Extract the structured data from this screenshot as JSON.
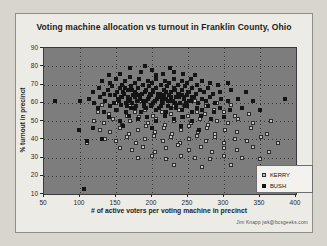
{
  "title": "Voting machine allocation vs turnout in Franklin County, Ohio",
  "credit": "Jim Knapp   jwk@bcsgeeks.com",
  "colors": {
    "page_background": "#d8d5cf",
    "panel_background": "#edebe6",
    "plot_background": "#7d7d7d",
    "kerry_marker_fill": "#c7c5c0",
    "kerry_marker_border": "#2d2d2d",
    "bush_marker": "#141414"
  },
  "chart_data": {
    "type": "scatter",
    "title": "Voting machine allocation vs turnout in Franklin County, Ohio",
    "xlabel": "# of active voters per voting machine in precinct",
    "ylabel": "% turnout in precinct",
    "xlim": [
      50,
      400
    ],
    "ylim": [
      10,
      90
    ],
    "xticks": [
      50,
      100,
      150,
      200,
      250,
      300,
      350,
      400
    ],
    "yticks": [
      10,
      20,
      30,
      40,
      50,
      60,
      70,
      80,
      90
    ],
    "grid": true,
    "legend_position": "inside-bottom-right",
    "series": [
      {
        "name": "KERRY",
        "marker": "open-square",
        "points": [
          [
            130,
            59
          ],
          [
            150,
            60
          ],
          [
            170,
            58
          ],
          [
            185,
            61
          ],
          [
            200,
            59
          ],
          [
            215,
            60
          ],
          [
            230,
            58
          ],
          [
            245,
            59
          ],
          [
            260,
            61
          ],
          [
            275,
            58
          ],
          [
            290,
            60
          ],
          [
            310,
            59
          ],
          [
            125,
            55
          ],
          [
            140,
            54
          ],
          [
            152,
            56
          ],
          [
            165,
            53
          ],
          [
            177,
            55
          ],
          [
            190,
            56
          ],
          [
            202,
            53
          ],
          [
            214,
            55
          ],
          [
            226,
            54
          ],
          [
            238,
            56
          ],
          [
            250,
            53
          ],
          [
            262,
            55
          ],
          [
            274,
            54
          ],
          [
            286,
            56
          ],
          [
            300,
            55
          ],
          [
            315,
            53
          ],
          [
            335,
            54
          ],
          [
            120,
            50
          ],
          [
            133,
            49
          ],
          [
            146,
            51
          ],
          [
            158,
            48
          ],
          [
            170,
            50
          ],
          [
            182,
            52
          ],
          [
            194,
            49
          ],
          [
            206,
            51
          ],
          [
            218,
            48
          ],
          [
            230,
            50
          ],
          [
            242,
            52
          ],
          [
            254,
            49
          ],
          [
            266,
            51
          ],
          [
            278,
            48
          ],
          [
            290,
            50
          ],
          [
            305,
            49
          ],
          [
            320,
            51
          ],
          [
            340,
            49
          ],
          [
            365,
            50
          ],
          [
            128,
            45
          ],
          [
            142,
            44
          ],
          [
            155,
            46
          ],
          [
            168,
            43
          ],
          [
            180,
            45
          ],
          [
            192,
            47
          ],
          [
            204,
            44
          ],
          [
            216,
            46
          ],
          [
            228,
            43
          ],
          [
            240,
            45
          ],
          [
            252,
            47
          ],
          [
            264,
            44
          ],
          [
            276,
            46
          ],
          [
            288,
            43
          ],
          [
            302,
            45
          ],
          [
            318,
            44
          ],
          [
            338,
            46
          ],
          [
            360,
            43
          ],
          [
            135,
            40
          ],
          [
            150,
            39
          ],
          [
            165,
            41
          ],
          [
            178,
            38
          ],
          [
            190,
            40
          ],
          [
            203,
            42
          ],
          [
            215,
            39
          ],
          [
            227,
            41
          ],
          [
            239,
            38
          ],
          [
            251,
            40
          ],
          [
            263,
            42
          ],
          [
            275,
            39
          ],
          [
            287,
            41
          ],
          [
            300,
            38
          ],
          [
            315,
            40
          ],
          [
            332,
            39
          ],
          [
            352,
            41
          ],
          [
            375,
            38
          ],
          [
            110,
            38
          ],
          [
            155,
            35
          ],
          [
            172,
            34
          ],
          [
            188,
            36
          ],
          [
            204,
            33
          ],
          [
            220,
            35
          ],
          [
            236,
            37
          ],
          [
            252,
            34
          ],
          [
            268,
            36
          ],
          [
            284,
            33
          ],
          [
            300,
            35
          ],
          [
            318,
            34
          ],
          [
            340,
            36
          ],
          [
            362,
            33
          ],
          [
            180,
            30
          ],
          [
            200,
            31
          ],
          [
            220,
            29
          ],
          [
            240,
            31
          ],
          [
            260,
            30
          ],
          [
            280,
            29
          ],
          [
            300,
            31
          ],
          [
            325,
            30
          ],
          [
            350,
            29
          ],
          [
            230,
            26
          ],
          [
            270,
            25
          ],
          [
            310,
            26
          ]
        ]
      },
      {
        "name": "BUSH",
        "marker": "filled-square",
        "points": [
          [
            170,
            79
          ],
          [
            190,
            80
          ],
          [
            185,
            77
          ],
          [
            200,
            78
          ],
          [
            215,
            76
          ],
          [
            225,
            79
          ],
          [
            230,
            77
          ],
          [
            155,
            76
          ],
          [
            243,
            76
          ],
          [
            140,
            75
          ],
          [
            260,
            75
          ],
          [
            205,
            75
          ],
          [
            130,
            72
          ],
          [
            142,
            71
          ],
          [
            150,
            73
          ],
          [
            158,
            70
          ],
          [
            163,
            72
          ],
          [
            170,
            74
          ],
          [
            176,
            71
          ],
          [
            182,
            73
          ],
          [
            188,
            70
          ],
          [
            194,
            72
          ],
          [
            200,
            71
          ],
          [
            206,
            73
          ],
          [
            212,
            70
          ],
          [
            218,
            72
          ],
          [
            224,
            71
          ],
          [
            230,
            73
          ],
          [
            236,
            70
          ],
          [
            242,
            72
          ],
          [
            248,
            71
          ],
          [
            254,
            73
          ],
          [
            262,
            70
          ],
          [
            270,
            72
          ],
          [
            280,
            71
          ],
          [
            292,
            70
          ],
          [
            305,
            71
          ],
          [
            118,
            66
          ],
          [
            126,
            68
          ],
          [
            133,
            65
          ],
          [
            139,
            67
          ],
          [
            145,
            69
          ],
          [
            151,
            66
          ],
          [
            156,
            68
          ],
          [
            161,
            65
          ],
          [
            166,
            67
          ],
          [
            171,
            69
          ],
          [
            176,
            66
          ],
          [
            181,
            68
          ],
          [
            186,
            65
          ],
          [
            191,
            67
          ],
          [
            196,
            69
          ],
          [
            201,
            66
          ],
          [
            206,
            68
          ],
          [
            211,
            65
          ],
          [
            216,
            67
          ],
          [
            221,
            69
          ],
          [
            226,
            66
          ],
          [
            231,
            68
          ],
          [
            236,
            65
          ],
          [
            241,
            67
          ],
          [
            246,
            69
          ],
          [
            251,
            66
          ],
          [
            256,
            68
          ],
          [
            261,
            65
          ],
          [
            266,
            67
          ],
          [
            272,
            66
          ],
          [
            278,
            68
          ],
          [
            285,
            65
          ],
          [
            295,
            66
          ],
          [
            310,
            67
          ],
          [
            330,
            66
          ],
          [
            112,
            62
          ],
          [
            120,
            60
          ],
          [
            128,
            63
          ],
          [
            135,
            61
          ],
          [
            141,
            64
          ],
          [
            147,
            60
          ],
          [
            153,
            62
          ],
          [
            159,
            63
          ],
          [
            164,
            60
          ],
          [
            169,
            62
          ],
          [
            174,
            64
          ],
          [
            179,
            61
          ],
          [
            184,
            63
          ],
          [
            189,
            60
          ],
          [
            194,
            62
          ],
          [
            199,
            64
          ],
          [
            204,
            61
          ],
          [
            209,
            63
          ],
          [
            214,
            60
          ],
          [
            219,
            62
          ],
          [
            224,
            64
          ],
          [
            229,
            61
          ],
          [
            234,
            63
          ],
          [
            239,
            60
          ],
          [
            244,
            62
          ],
          [
            249,
            64
          ],
          [
            254,
            61
          ],
          [
            259,
            63
          ],
          [
            264,
            60
          ],
          [
            269,
            62
          ],
          [
            275,
            61
          ],
          [
            281,
            63
          ],
          [
            288,
            60
          ],
          [
            296,
            62
          ],
          [
            306,
            61
          ],
          [
            320,
            62
          ],
          [
            340,
            61
          ],
          [
            65,
            61
          ],
          [
            100,
            61
          ],
          [
            385,
            62
          ],
          [
            148,
            64
          ],
          [
            154,
            61
          ],
          [
            160,
            66
          ],
          [
            166,
            63
          ],
          [
            172,
            60
          ],
          [
            178,
            65
          ],
          [
            184,
            62
          ],
          [
            190,
            66
          ],
          [
            196,
            63
          ],
          [
            202,
            60
          ],
          [
            208,
            65
          ],
          [
            214,
            62
          ],
          [
            220,
            66
          ],
          [
            226,
            63
          ],
          [
            232,
            60
          ],
          [
            238,
            65
          ],
          [
            244,
            63
          ],
          [
            250,
            66
          ],
          [
            256,
            63
          ],
          [
            157,
            63
          ],
          [
            167,
            61
          ],
          [
            177,
            63
          ],
          [
            187,
            61
          ],
          [
            197,
            65
          ],
          [
            207,
            62
          ],
          [
            217,
            64
          ],
          [
            227,
            61
          ],
          [
            237,
            63
          ],
          [
            247,
            60
          ],
          [
            172,
            67
          ],
          [
            182,
            64
          ],
          [
            192,
            61
          ],
          [
            202,
            67
          ],
          [
            212,
            64
          ],
          [
            222,
            61
          ],
          [
            232,
            67
          ],
          [
            242,
            64
          ],
          [
            252,
            61
          ],
          [
            162,
            68
          ],
          [
            198,
            58
          ],
          [
            210,
            57
          ],
          [
            222,
            58
          ],
          [
            234,
            57
          ],
          [
            246,
            58
          ],
          [
            165,
            58
          ],
          [
            177,
            57
          ],
          [
            189,
            58
          ],
          [
            125,
            57
          ],
          [
            134,
            55
          ],
          [
            142,
            58
          ],
          [
            150,
            56
          ],
          [
            157,
            59
          ],
          [
            164,
            55
          ],
          [
            171,
            57
          ],
          [
            178,
            58
          ],
          [
            185,
            55
          ],
          [
            192,
            57
          ],
          [
            199,
            59
          ],
          [
            206,
            56
          ],
          [
            213,
            58
          ],
          [
            220,
            55
          ],
          [
            227,
            57
          ],
          [
            234,
            59
          ],
          [
            241,
            56
          ],
          [
            248,
            58
          ],
          [
            255,
            55
          ],
          [
            262,
            57
          ],
          [
            270,
            56
          ],
          [
            278,
            58
          ],
          [
            286,
            55
          ],
          [
            295,
            57
          ],
          [
            308,
            56
          ],
          [
            325,
            57
          ],
          [
            350,
            56
          ],
          [
            140,
            52
          ],
          [
            155,
            50
          ],
          [
            168,
            53
          ],
          [
            180,
            51
          ],
          [
            193,
            52
          ],
          [
            205,
            50
          ],
          [
            218,
            53
          ],
          [
            230,
            51
          ],
          [
            243,
            52
          ],
          [
            256,
            50
          ],
          [
            268,
            53
          ],
          [
            282,
            51
          ],
          [
            300,
            52
          ],
          [
            98,
            45
          ],
          [
            118,
            46
          ],
          [
            160,
            47
          ],
          [
            200,
            46
          ],
          [
            240,
            47
          ],
          [
            265,
            45
          ],
          [
            105,
            13
          ],
          [
            110,
            39
          ],
          [
            130,
            40
          ]
        ]
      }
    ]
  }
}
